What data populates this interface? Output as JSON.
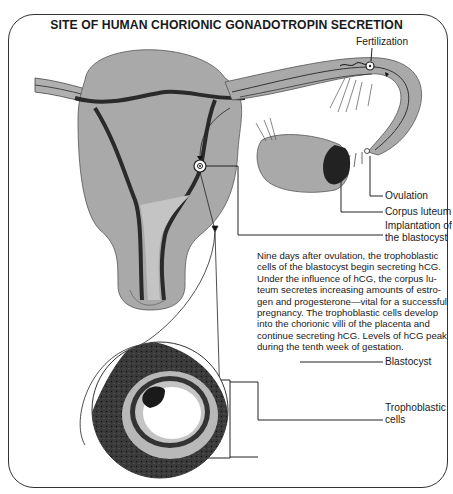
{
  "title": "SITE OF HUMAN CHORIONIC GONADOTROPIN SECRETION",
  "labels": {
    "fertilization": "Fertilization",
    "ovulation": "Ovulation",
    "corpus_luteum": "Corpus luteum",
    "implantation_line1": "Implantation of",
    "implantation_line2": "the blastocyst",
    "blastocyst": "Blastocyst",
    "trophoblastic_line1": "Trophoblastic",
    "trophoblastic_line2": "cells"
  },
  "description": "Nine days after ovulation, the trophoblastic\ncells of the blastocyst begin secreting hCG.\nUnder the influence of hCG, the corpus lu-\nteum secretes increasing amounts of estro-\ngen and progesterone—vital for a successful\npregnancy. The trophoblastic cells develop\ninto the chorionic villi of the placenta and\ncontinue secreting hCG. Levels of hCG peak\nduring the tenth week of gestation.",
  "colors": {
    "tissue": "#a9a9a9",
    "tissue_light": "#c4c4c4",
    "dark": "#2a2a2a",
    "line": "#222222"
  }
}
